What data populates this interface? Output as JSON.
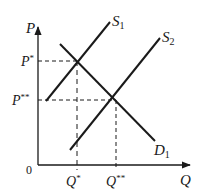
{
  "diagram": {
    "type": "supply-demand",
    "axes": {
      "y_label": "P",
      "x_label": "Q",
      "origin_label": "0"
    },
    "curves": [
      {
        "name": "S",
        "subscript": "1",
        "kind": "supply"
      },
      {
        "name": "S",
        "subscript": "2",
        "kind": "supply"
      },
      {
        "name": "D",
        "subscript": "1",
        "kind": "demand"
      }
    ],
    "equilibria": [
      {
        "price_label": "P",
        "price_sup": "*",
        "quantity_label": "Q",
        "quantity_sup": "*"
      },
      {
        "price_label": "P",
        "price_sup": "**",
        "quantity_label": "Q",
        "quantity_sup": "**"
      }
    ],
    "colors": {
      "line": "#1a1a1a",
      "background": "#ffffff"
    }
  }
}
